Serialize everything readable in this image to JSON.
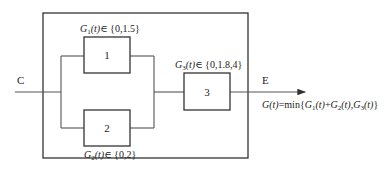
{
  "diagram": {
    "input_label": "C",
    "output_label": "E",
    "components": [
      {
        "id": "1",
        "label": "1",
        "state_var": "G",
        "subscript": "1",
        "arg": "(t)",
        "set": "∈ {0,1.5}"
      },
      {
        "id": "2",
        "label": "2",
        "state_var": "G",
        "subscript": "2",
        "arg": "(t)",
        "set": "∈ {0,2}"
      },
      {
        "id": "3",
        "label": "3",
        "state_var": "G",
        "subscript": "3",
        "arg": "(t)",
        "set": "∈ {0,1.8,4}"
      }
    ],
    "formula": {
      "lhs": "G",
      "lhs_arg": "(t)",
      "rhs_prefix": "=min{",
      "term1": "G",
      "term1_sub": "1",
      "term1_arg": "(t)",
      "plus": "+",
      "term2": "G",
      "term2_sub": "2",
      "term2_arg": "(t)",
      "comma": ",",
      "term3": "G",
      "term3_sub": "3",
      "term3_arg": "(t)",
      "close": "}"
    },
    "colors": {
      "line": "#555555",
      "box": "#333333",
      "text": "#222222"
    }
  }
}
